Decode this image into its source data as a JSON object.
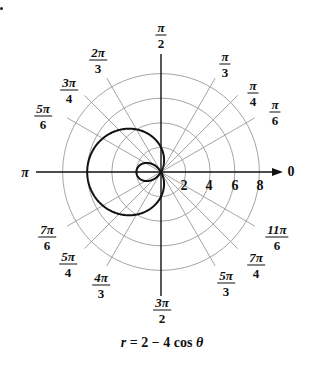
{
  "chart_data": {
    "type": "polar-line",
    "title": "r = 2 − 4 cos θ",
    "equation": {
      "lhs": "r",
      "rhs_prefix": "= 2 − 4 cos ",
      "var": "θ"
    },
    "radial_ticks": [
      2,
      4,
      6,
      8
    ],
    "radial_range": [
      0,
      8
    ],
    "angle_labels": [
      {
        "num": "",
        "den": "",
        "text": "0",
        "angle_deg": 0
      },
      {
        "num": "π",
        "den": "6",
        "angle_deg": 30
      },
      {
        "num": "π",
        "den": "4",
        "angle_deg": 45
      },
      {
        "num": "π",
        "den": "3",
        "angle_deg": 60
      },
      {
        "num": "π",
        "den": "2",
        "angle_deg": 90
      },
      {
        "num": "2π",
        "den": "3",
        "angle_deg": 120
      },
      {
        "num": "3π",
        "den": "4",
        "angle_deg": 135
      },
      {
        "num": "5π",
        "den": "6",
        "angle_deg": 150
      },
      {
        "num": "",
        "den": "",
        "text": "π",
        "angle_deg": 180
      },
      {
        "num": "7π",
        "den": "6",
        "angle_deg": 210
      },
      {
        "num": "5π",
        "den": "4",
        "angle_deg": 225
      },
      {
        "num": "4π",
        "den": "3",
        "angle_deg": 240
      },
      {
        "num": "3π",
        "den": "2",
        "angle_deg": 270
      },
      {
        "num": "5π",
        "den": "3",
        "angle_deg": 300
      },
      {
        "num": "7π",
        "den": "4",
        "angle_deg": 315
      },
      {
        "num": "11π",
        "den": "6",
        "angle_deg": 330
      }
    ],
    "series": [
      {
        "name": "r = 2 - 4 cos θ",
        "theta_deg": [
          0,
          30,
          45,
          60,
          90,
          120,
          135,
          150,
          180,
          210,
          225,
          240,
          270,
          300,
          315,
          330,
          360
        ],
        "r": [
          -2,
          -1.46,
          -0.83,
          0,
          2,
          4,
          4.83,
          5.46,
          6,
          5.46,
          4.83,
          4,
          2,
          0,
          -0.83,
          -1.46,
          -2
        ]
      }
    ],
    "curve_color": "#111111",
    "grid_color": "#9a9a9a",
    "axis_color": "#111111",
    "grid": true
  },
  "labels": {
    "zero": "0",
    "pi": "π",
    "ticks": [
      "2",
      "4",
      "6",
      "8"
    ]
  }
}
